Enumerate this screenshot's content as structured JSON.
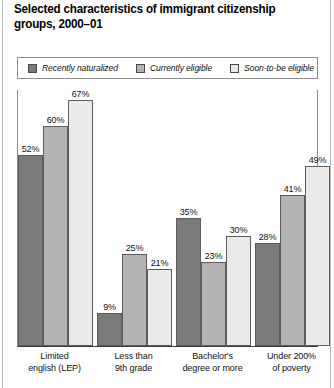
{
  "title": "Selected characteristics of immigrant citizenship groups, 2000–01",
  "legend": {
    "items": [
      {
        "label": "Recently naturalized",
        "color": "#7b7b7b",
        "swatch_name": "legend-swatch-recently-naturalized"
      },
      {
        "label": "Currently eligible",
        "color": "#b4b4b4",
        "swatch_name": "legend-swatch-currently-eligible"
      },
      {
        "label": "Soon-to-be eligible",
        "color": "#eaeaea",
        "swatch_name": "legend-swatch-soon-to-be-eligible"
      }
    ]
  },
  "chart_data": {
    "type": "bar",
    "title": "Selected characteristics of immigrant citizenship groups, 2000–01",
    "xlabel": "",
    "ylabel": "",
    "ylim": [
      0,
      70
    ],
    "grid": false,
    "legend_position": "top",
    "categories": [
      "Limited english (LEP)",
      "Less than 9th grade",
      "Bachelor's degree or more",
      "Under 200% of poverty"
    ],
    "category_lines": [
      [
        "Limited",
        "english (LEP)"
      ],
      [
        "Less than",
        "9th grade"
      ],
      [
        "Bachelor's",
        "degree or more"
      ],
      [
        "Under 200%",
        "of poverty"
      ]
    ],
    "series": [
      {
        "name": "Recently naturalized",
        "color": "#7b7b7b",
        "values": [
          52,
          9,
          35,
          28
        ],
        "labels": [
          "52%",
          "9%",
          "35%",
          "28%"
        ]
      },
      {
        "name": "Currently eligible",
        "color": "#b4b4b4",
        "values": [
          60,
          25,
          23,
          41
        ],
        "labels": [
          "60%",
          "25%",
          "23%",
          "41%"
        ]
      },
      {
        "name": "Soon-to-be eligible",
        "color": "#eaeaea",
        "values": [
          67,
          21,
          30,
          49
        ],
        "labels": [
          "67%",
          "21%",
          "30%",
          "49%"
        ]
      }
    ]
  }
}
